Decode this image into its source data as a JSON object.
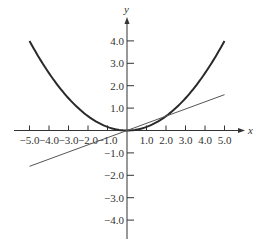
{
  "chart_data": {
    "type": "line",
    "title": "",
    "xlabel": "x",
    "ylabel": "y",
    "xlim": [
      -5.0,
      5.0
    ],
    "ylim": [
      -4.0,
      4.0
    ],
    "grid": false,
    "legend": null,
    "x_ticks": [
      -5.0,
      -4.0,
      -3.0,
      -2.0,
      -1.0,
      1.0,
      2.0,
      3.0,
      4.0,
      5.0
    ],
    "x_tick_labels": [
      "-5.0",
      "-4.0",
      "-3.0",
      "-2.0",
      "-1.0",
      "1.0",
      "2.0",
      "3.0",
      "4.0",
      "5.0"
    ],
    "y_ticks": [
      4.0,
      3.0,
      2.0,
      1.0,
      -1.0,
      -2.0,
      -3.0,
      -4.0
    ],
    "y_tick_labels": [
      "4.0",
      "3.0",
      "2.0",
      "1.0",
      "-1.0",
      "-2.0",
      "-3.0",
      "-4.0"
    ],
    "series": [
      {
        "name": "parabola",
        "equation": "y = 0.16x^2",
        "style": "thick",
        "x": [
          -5,
          -4,
          -3,
          -2,
          -1,
          0,
          1,
          2,
          3,
          4,
          5
        ],
        "y": [
          4.0,
          2.56,
          1.44,
          0.64,
          0.16,
          0,
          0.16,
          0.64,
          1.44,
          2.56,
          4.0
        ]
      },
      {
        "name": "line",
        "equation": "y = 0.32x",
        "style": "thin",
        "x": [
          -5,
          5
        ],
        "y": [
          -1.6,
          1.6
        ]
      }
    ]
  },
  "axes": {
    "x_label": "x",
    "y_label": "y"
  },
  "colors": {
    "axis": "#333333",
    "curve": "#2a2a2a",
    "line": "#555555"
  }
}
